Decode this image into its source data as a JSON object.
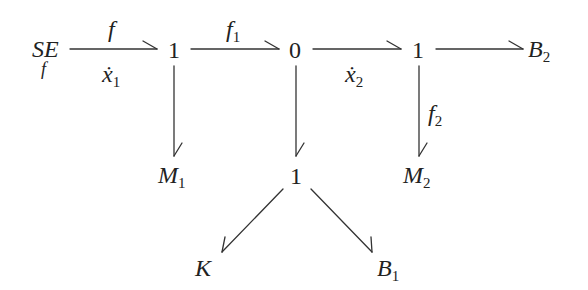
{
  "diagram": {
    "type": "bond-graph",
    "nodes": {
      "se": {
        "main": "SE",
        "sub_below": "f"
      },
      "junction1a": {
        "label": "1"
      },
      "junction0": {
        "label": "0"
      },
      "junction1b": {
        "label": "1"
      },
      "b2": {
        "main": "B",
        "sub": "2"
      },
      "m1": {
        "main": "M",
        "sub": "1"
      },
      "junction1c": {
        "label": "1"
      },
      "m2": {
        "main": "M",
        "sub": "2"
      },
      "k": {
        "main": "K"
      },
      "b1": {
        "main": "B",
        "sub": "1"
      }
    },
    "edge_labels": {
      "se_to_1a_top": {
        "main": "f"
      },
      "se_to_1a_bottom": {
        "main": "ẋ",
        "sub": "1"
      },
      "1a_to_0_top": {
        "main": "f",
        "sub": "1"
      },
      "0_to_1b_bottom": {
        "main": "ẋ",
        "sub": "2"
      },
      "1b_to_m2_side": {
        "main": "f",
        "sub": "2"
      }
    },
    "edges": [
      {
        "from": "SE",
        "to": "1"
      },
      {
        "from": "1",
        "to": "0"
      },
      {
        "from": "0",
        "to": "1"
      },
      {
        "from": "1",
        "to": "B2"
      },
      {
        "from": "1",
        "to": "M1"
      },
      {
        "from": "0",
        "to": "1"
      },
      {
        "from": "1",
        "to": "M2"
      },
      {
        "from": "1",
        "to": "K"
      },
      {
        "from": "1",
        "to": "B1"
      }
    ]
  }
}
